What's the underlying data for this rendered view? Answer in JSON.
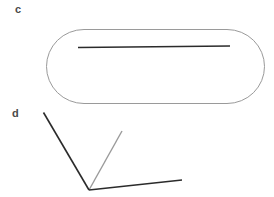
{
  "figure": {
    "width": 274,
    "height": 197,
    "background_color": "#ffffff",
    "panels": [
      {
        "id": "c",
        "label": "c",
        "label_color": "#4a4a4a",
        "label_position": {
          "x": 15,
          "y": 4
        },
        "description": "stadium outline containing a horizontal line segment",
        "shapes": [
          {
            "name": "stadium-outline",
            "type": "rounded-rectangle",
            "stroke_color": "#9a9a9a",
            "stroke_width": 1,
            "fill": "none",
            "x": 46,
            "y": 29,
            "width": 219,
            "height": 75,
            "corner_radius": 37.5
          },
          {
            "name": "inner-horizontal-line",
            "type": "line",
            "stroke_color": "#2b2b2b",
            "stroke_width": 1.3,
            "x1": 78,
            "y1": 47.5,
            "x2": 230,
            "y2": 46.0
          }
        ]
      },
      {
        "id": "d",
        "label": "d",
        "label_color": "#4a4a4a",
        "label_position": {
          "x": 12,
          "y": 108
        },
        "description": "dark angled V with a lighter gray ray from the same vertex",
        "shapes": [
          {
            "name": "dark-left-arm",
            "type": "line",
            "stroke_color": "#2b2b2b",
            "stroke_width": 1.6,
            "x1": 43.5,
            "y1": 112.5,
            "x2": 89.0,
            "y2": 190.0
          },
          {
            "name": "dark-right-arm",
            "type": "line",
            "stroke_color": "#2b2b2b",
            "stroke_width": 1.6,
            "x1": 89.0,
            "y1": 190.0,
            "x2": 182.0,
            "y2": 180.0
          },
          {
            "name": "gray-ray",
            "type": "line",
            "stroke_color": "#9a9a9a",
            "stroke_width": 1.4,
            "x1": 89.0,
            "y1": 190.0,
            "x2": 122.0,
            "y2": 131.0
          }
        ]
      }
    ]
  }
}
